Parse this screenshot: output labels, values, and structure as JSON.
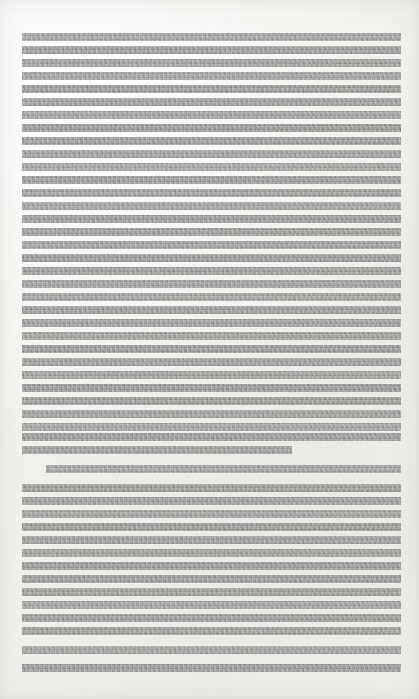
{
  "document": {
    "page_width": 419,
    "page_height": 699,
    "background_color": "#f4f3f0",
    "redaction_color": "#9c9c9b",
    "description": "Scanned document page with all body text obscured by solid gray redaction bars",
    "visible_text": "",
    "text_margin_left": 22,
    "text_margin_right": 401,
    "text_column_width": 379,
    "line_height_px": 8,
    "line_pitch_px": 13,
    "first_line_top": 33,
    "last_line_bottom": 672,
    "paragraph_count": 2,
    "total_redacted_lines": 48
  },
  "paragraphs": [
    {
      "id": "paragraph-1",
      "indent_first_line": false,
      "line_count": 33,
      "lines": [
        {
          "top": 33,
          "left": 22,
          "width": 379
        },
        {
          "top": 46,
          "left": 22,
          "width": 379
        },
        {
          "top": 59,
          "left": 22,
          "width": 379
        },
        {
          "top": 72,
          "left": 22,
          "width": 379
        },
        {
          "top": 85,
          "left": 22,
          "width": 379
        },
        {
          "top": 98,
          "left": 22,
          "width": 379
        },
        {
          "top": 111,
          "left": 22,
          "width": 379
        },
        {
          "top": 124,
          "left": 22,
          "width": 379
        },
        {
          "top": 137,
          "left": 22,
          "width": 379
        },
        {
          "top": 150,
          "left": 22,
          "width": 379
        },
        {
          "top": 163,
          "left": 22,
          "width": 379
        },
        {
          "top": 176,
          "left": 22,
          "width": 379
        },
        {
          "top": 189,
          "left": 22,
          "width": 379
        },
        {
          "top": 202,
          "left": 22,
          "width": 379
        },
        {
          "top": 215,
          "left": 22,
          "width": 379
        },
        {
          "top": 228,
          "left": 22,
          "width": 379
        },
        {
          "top": 241,
          "left": 22,
          "width": 379
        },
        {
          "top": 254,
          "left": 22,
          "width": 379
        },
        {
          "top": 267,
          "left": 22,
          "width": 379
        },
        {
          "top": 280,
          "left": 22,
          "width": 379
        },
        {
          "top": 293,
          "left": 22,
          "width": 379
        },
        {
          "top": 306,
          "left": 22,
          "width": 379
        },
        {
          "top": 319,
          "left": 22,
          "width": 379
        },
        {
          "top": 332,
          "left": 22,
          "width": 379
        },
        {
          "top": 345,
          "left": 22,
          "width": 379
        },
        {
          "top": 358,
          "left": 22,
          "width": 379
        },
        {
          "top": 371,
          "left": 22,
          "width": 379
        },
        {
          "top": 384,
          "left": 22,
          "width": 379
        },
        {
          "top": 397,
          "left": 22,
          "width": 379
        },
        {
          "top": 410,
          "left": 22,
          "width": 379
        },
        {
          "top": 423,
          "left": 22,
          "width": 379
        },
        {
          "top": 433,
          "left": 22,
          "width": 379
        },
        {
          "top": 446,
          "left": 22,
          "width": 270
        }
      ]
    },
    {
      "id": "paragraph-2",
      "indent_first_line": true,
      "indent_px": 24,
      "line_count": 15,
      "lines": [
        {
          "top": 465,
          "left": 46,
          "width": 355
        },
        {
          "top": 484,
          "left": 22,
          "width": 379
        },
        {
          "top": 497,
          "left": 22,
          "width": 379
        },
        {
          "top": 510,
          "left": 22,
          "width": 379
        },
        {
          "top": 523,
          "left": 22,
          "width": 379
        },
        {
          "top": 536,
          "left": 22,
          "width": 379
        },
        {
          "top": 549,
          "left": 22,
          "width": 379
        },
        {
          "top": 562,
          "left": 22,
          "width": 379
        },
        {
          "top": 575,
          "left": 22,
          "width": 379
        },
        {
          "top": 588,
          "left": 22,
          "width": 379
        },
        {
          "top": 601,
          "left": 22,
          "width": 379
        },
        {
          "top": 614,
          "left": 22,
          "width": 379
        },
        {
          "top": 627,
          "left": 22,
          "width": 379
        },
        {
          "top": 646,
          "left": 22,
          "width": 379
        },
        {
          "top": 664,
          "left": 22,
          "width": 379
        }
      ]
    }
  ]
}
